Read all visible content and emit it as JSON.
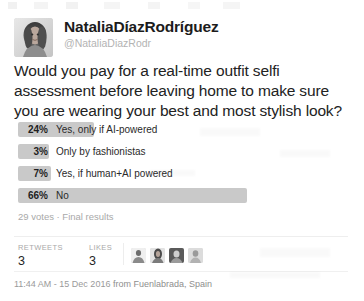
{
  "tweet": {
    "author": {
      "display_name": "NataliaDíazRodríguez",
      "handle": "@NataliaDiazRodr",
      "avatar_icon": "user-photo-avatar"
    },
    "text": "Would you pay for a real-time outfit selfi assessment before leaving home to make sure you are wearing your best and most stylish look?",
    "poll": {
      "options": [
        {
          "percent": "24%",
          "label": "Yes, only if AI-powered",
          "value": 24
        },
        {
          "percent": "3%",
          "label": "Only by fashionistas",
          "value": 3
        },
        {
          "percent": "7%",
          "label": "Yes, if human+AI powered",
          "value": 7
        },
        {
          "percent": "66%",
          "label": "No",
          "value": 66
        }
      ],
      "meta": "29 votes · Final results",
      "bar_color": "#c9c9c9"
    },
    "stats": {
      "retweets_label": "RETWEETS",
      "retweets_value": "3",
      "likes_label": "LIKES",
      "likes_value": "3"
    },
    "facepile": [
      {
        "name": "liker-avatar-1"
      },
      {
        "name": "liker-avatar-2"
      },
      {
        "name": "liker-avatar-3"
      },
      {
        "name": "liker-avatar-4"
      }
    ],
    "footer": {
      "time": "11:44 AM - 15 Dec 2016",
      "from": "from Fuenlabrada, Spain"
    }
  }
}
